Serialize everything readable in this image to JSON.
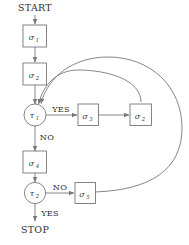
{
  "diagram": {
    "stroke_color": "#77787a",
    "text_color": "#2e2e2e",
    "background_color": "#ffffff",
    "terminals": {
      "start": "START",
      "stop": "STOP"
    },
    "process_nodes": [
      {
        "id": "s1",
        "symbol": "σ",
        "subscript": "1",
        "shape": "rectangle"
      },
      {
        "id": "s2_main",
        "symbol": "σ",
        "subscript": "2",
        "shape": "rectangle"
      },
      {
        "id": "s3",
        "symbol": "σ",
        "subscript": "3",
        "shape": "rectangle"
      },
      {
        "id": "s2_right",
        "symbol": "σ",
        "subscript": "2",
        "shape": "rectangle"
      },
      {
        "id": "s4",
        "symbol": "σ",
        "subscript": "4",
        "shape": "rectangle"
      },
      {
        "id": "s5",
        "symbol": "σ",
        "subscript": "5",
        "shape": "rectangle"
      }
    ],
    "decision_nodes": [
      {
        "id": "t1",
        "symbol": "τ",
        "subscript": "1",
        "shape": "circle"
      },
      {
        "id": "t2",
        "symbol": "τ",
        "subscript": "2",
        "shape": "circle"
      }
    ],
    "branch_labels": {
      "t1_yes": "YES",
      "t1_no": "NO",
      "t2_no": "NO",
      "t2_yes": "YES"
    }
  }
}
